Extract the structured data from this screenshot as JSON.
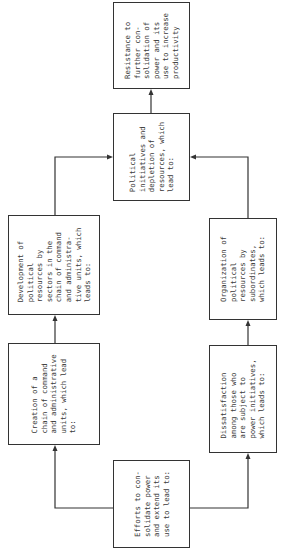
{
  "diagram": {
    "title": "",
    "orientation": "rotated 90° counter-clockwise",
    "nodes": [
      {
        "id": "efforts",
        "text": "Efforts to con-\nsolidate power\nand extend its\nuse to lead to:"
      },
      {
        "id": "creation",
        "text": "Creation of a\nchain of command\nand administrative\nunits, which lead\nto:"
      },
      {
        "id": "development",
        "text": "Development of\npolitical\nresources by\nsectors in the\nchain of command\nand administra-\ntive units, which\nleads to:"
      },
      {
        "id": "dissatisfaction",
        "text": "Dissatisfaction\namong those who\nare subject to\npower initiatives,\nwhich leads to:"
      },
      {
        "id": "organization",
        "text": "Organization of\npolitical\nresources by\nsubordinates,\nwhich leads to:"
      },
      {
        "id": "political",
        "text": "Political\ninitiatives and\ndepletion of\nresources, which\nlead to:"
      },
      {
        "id": "resistance",
        "text": "Resistance to\nfurther con-\nsolidation of\npower and its\nuse to increase\nproductivity"
      }
    ],
    "edges": [
      {
        "from": "efforts",
        "to": "creation"
      },
      {
        "from": "efforts",
        "to": "dissatisfaction"
      },
      {
        "from": "creation",
        "to": "development"
      },
      {
        "from": "dissatisfaction",
        "to": "organization"
      },
      {
        "from": "development",
        "to": "political"
      },
      {
        "from": "organization",
        "to": "political"
      },
      {
        "from": "political",
        "to": "resistance"
      }
    ]
  }
}
